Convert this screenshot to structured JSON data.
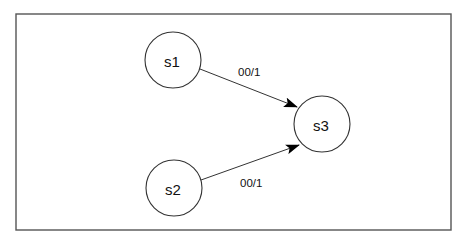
{
  "diagram": {
    "type": "state-transition-diagram",
    "frame": {
      "x": 16,
      "y": 14,
      "width": 435,
      "height": 216,
      "stroke": "#555555"
    },
    "states": [
      {
        "id": "s1",
        "label": "s1",
        "cx": 173,
        "cy": 60,
        "r": 28
      },
      {
        "id": "s2",
        "label": "s2",
        "cx": 174,
        "cy": 188,
        "r": 28
      },
      {
        "id": "s3",
        "label": "s3",
        "cx": 322,
        "cy": 124,
        "r": 28
      }
    ],
    "transitions": [
      {
        "from": "s1",
        "to": "s3",
        "label": "00/1",
        "x1": 200,
        "y1": 69,
        "x2": 297,
        "y2": 107,
        "label_x": 238,
        "label_y": 72
      },
      {
        "from": "s2",
        "to": "s3",
        "label": "00/1",
        "x1": 201,
        "y1": 180,
        "x2": 299,
        "y2": 145,
        "label_x": 240,
        "label_y": 183
      }
    ]
  }
}
